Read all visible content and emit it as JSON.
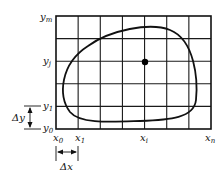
{
  "diagram": {
    "grid": {
      "columns": 7,
      "rows": 5
    },
    "y_labels": [
      {
        "id": "ym",
        "base": "y",
        "sub": "m"
      },
      {
        "id": "yj",
        "base": "y",
        "sub": "j"
      },
      {
        "id": "y1",
        "base": "y",
        "sub": "1"
      },
      {
        "id": "y0",
        "base": "y",
        "sub": "0"
      }
    ],
    "x_labels": [
      {
        "id": "x0",
        "base": "x",
        "sub": "0"
      },
      {
        "id": "x1",
        "base": "x",
        "sub": "1"
      },
      {
        "id": "xi",
        "base": "x",
        "sub": "i"
      },
      {
        "id": "xn",
        "base": "x",
        "sub": "n"
      }
    ],
    "delta_y": {
      "base": "Δy"
    },
    "delta_x": {
      "base": "Δx"
    },
    "point": {
      "label": "(x_i, y_j)",
      "color": "#000000"
    }
  }
}
